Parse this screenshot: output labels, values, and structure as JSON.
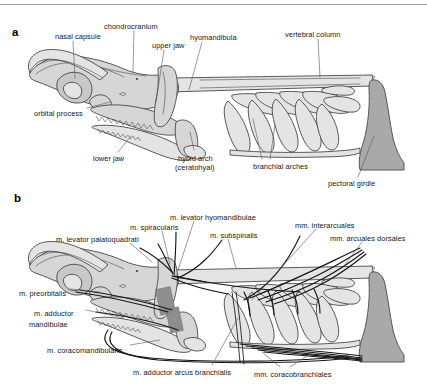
{
  "figure": {
    "type": "anatomical-diagram",
    "background_color": "#ffffff",
    "top_rule_color": "#9a9a9a",
    "panels": [
      {
        "letter": "a",
        "title": "skeletal elements",
        "labels": [
          {
            "id": "nasal-capsule",
            "text": "nasal capsule",
            "x": 55,
            "y": 33
          },
          {
            "id": "chondrocranium",
            "text": "chondrocranium",
            "x": 104,
            "y": 23
          },
          {
            "id": "upper-jaw",
            "text": "upper jaw",
            "x": 152,
            "y": 42
          },
          {
            "id": "hyomandibula",
            "text": "hyomandibula",
            "x": 190,
            "y": 34
          },
          {
            "id": "vertebral-column",
            "text": "vertebral column",
            "x": 285,
            "y": 31
          },
          {
            "id": "orbital-process",
            "text": "orbital process",
            "x": 34,
            "y": 110
          },
          {
            "id": "lower-jaw",
            "text": "lower jaw",
            "x": 93,
            "y": 155
          },
          {
            "id": "hyoid-arch",
            "text": "hyoid arch",
            "x": 178,
            "y": 155
          },
          {
            "id": "ceratohyal",
            "text": "(ceratohyal)",
            "x": 175,
            "y": 164
          },
          {
            "id": "branchial-arches",
            "text": "branchial arches",
            "x": 253,
            "y": 163
          },
          {
            "id": "pectoral-girdle",
            "text": "pectoral girdle",
            "x": 328,
            "y": 180
          }
        ]
      },
      {
        "letter": "b",
        "title": "musculature",
        "labels": [
          {
            "id": "m-levator-palatoquadrati",
            "text": "m. levator palatoquadrati",
            "x": 56,
            "y": 236
          },
          {
            "id": "m-spiracularis",
            "text": "m. spiracularis",
            "x": 130,
            "y": 224
          },
          {
            "id": "m-levator-hyomandibulae",
            "text": "m. levator hyomandibulae",
            "x": 170,
            "y": 214
          },
          {
            "id": "m-subspinalis",
            "text": "m. subspinalis",
            "x": 210,
            "y": 232
          },
          {
            "id": "mm-interarcuales",
            "text": "mm. interarcuales",
            "x": 295,
            "y": 222
          },
          {
            "id": "mm-arcuales-dorsales",
            "text": "mm. arcuales dorsales",
            "x": 330,
            "y": 235
          },
          {
            "id": "m-preorbitalis",
            "text": "m. preorbitalis",
            "x": 19,
            "y": 290
          },
          {
            "id": "m-adductor-mandibulae-1",
            "text": "m. adductor",
            "x": 34,
            "y": 310
          },
          {
            "id": "m-adductor-mandibulae-2",
            "text": "mandibulae",
            "x": 29,
            "y": 321
          },
          {
            "id": "m-coracomandibularis",
            "text": "m. coracomandibularis",
            "x": 47,
            "y": 347
          },
          {
            "id": "m-adductor-arcus-branchialis",
            "text": "m. adductor arcus branchialis",
            "x": 133,
            "y": 369
          },
          {
            "id": "mm-coracobranchiales",
            "text": "mm. coracobranchiales",
            "x": 254,
            "y": 371
          }
        ]
      }
    ],
    "palette": {
      "outline": "#3a3a3a",
      "cartilage_light": "#e2e2e2",
      "cartilage_mid": "#d2d2d2",
      "cartilage_dark": "#c2c2c2",
      "pectoral_girdle": "#a9a9a9",
      "muscle_block": "#8e8e8e",
      "leader_line": "#4a4a4a",
      "muscle_line": "#1a1a1a",
      "text": "#161616"
    }
  }
}
